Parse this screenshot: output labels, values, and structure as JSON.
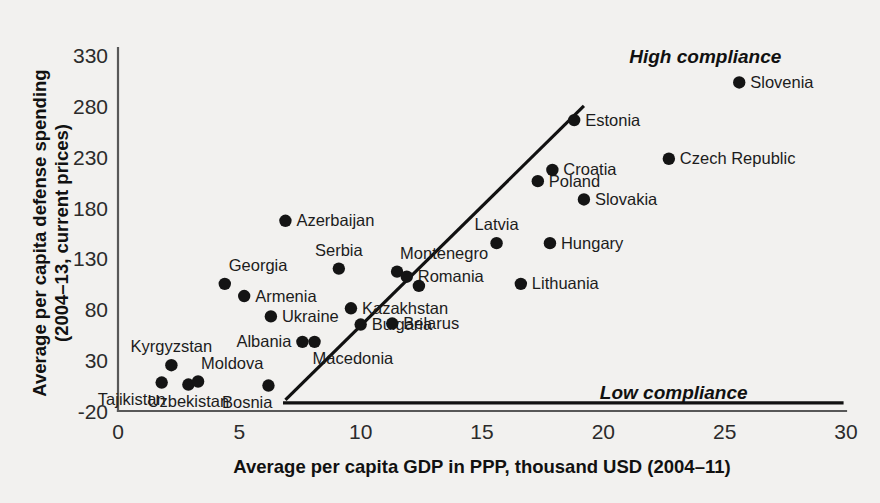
{
  "chart_data": {
    "type": "scatter",
    "title": "",
    "xlabel": "Average per capita GDP in PPP, thousand USD (2004–11)",
    "ylabel": "Average per capita defense spending\n(2004–13, current prices)",
    "xlim": [
      0,
      30
    ],
    "ylim": [
      -20,
      330
    ],
    "xticks": [
      "0",
      "5",
      "10",
      "15",
      "20",
      "25",
      "30"
    ],
    "xtick_values": [
      0,
      5,
      10,
      15,
      20,
      25,
      30
    ],
    "yticks": [
      "-20",
      "30",
      "80",
      "130",
      "180",
      "230",
      "280",
      "330"
    ],
    "ytick_values": [
      -20,
      30,
      80,
      130,
      180,
      230,
      280,
      330
    ],
    "grid": false,
    "legend": null,
    "annotations": [
      {
        "name": "high-compliance",
        "text": "High compliance",
        "x": 24.2,
        "y": 322,
        "style": "bold-italic"
      },
      {
        "name": "low-compliance",
        "text": "Low compliance",
        "x": 22.9,
        "y": -8,
        "style": "bold-italic"
      }
    ],
    "reference_lines": [
      {
        "name": "compliance-diagonal",
        "type": "segment",
        "x1": 6.9,
        "y1": -9,
        "x2": 19.2,
        "y2": 280
      },
      {
        "name": "compliance-baseline",
        "type": "segment",
        "x1": 6.8,
        "y1": -12,
        "x2": 29.9,
        "y2": -12
      }
    ],
    "points": [
      {
        "label": "Tajikistan",
        "x": 1.8,
        "y": 8,
        "label_pos": "below-left"
      },
      {
        "label": "Kyrgyzstan",
        "x": 2.2,
        "y": 25,
        "label_pos": "above"
      },
      {
        "label": "Uzbekistan",
        "x": 2.9,
        "y": 6,
        "label_pos": "below"
      },
      {
        "label": "Moldova",
        "x": 3.3,
        "y": 9,
        "label_pos": "above-right"
      },
      {
        "label": "Georgia",
        "x": 4.4,
        "y": 105,
        "label_pos": "above-left"
      },
      {
        "label": "Armenia",
        "x": 5.2,
        "y": 93,
        "label_pos": "right"
      },
      {
        "label": "Bosnia",
        "x": 6.2,
        "y": 5,
        "label_pos": "below-left"
      },
      {
        "label": "Ukraine",
        "x": 6.3,
        "y": 73,
        "label_pos": "right"
      },
      {
        "label": "Azerbaijan",
        "x": 6.9,
        "y": 167,
        "label_pos": "right"
      },
      {
        "label": "Albania",
        "x": 7.6,
        "y": 48,
        "label_pos": "left"
      },
      {
        "label": "Macedonia",
        "x": 8.1,
        "y": 48,
        "label_pos": "below-right"
      },
      {
        "label": "Serbia",
        "x": 9.1,
        "y": 120,
        "label_pos": "above"
      },
      {
        "label": "Kazakhstan",
        "x": 9.6,
        "y": 81,
        "label_pos": "right"
      },
      {
        "label": "Bulgaria",
        "x": 10.0,
        "y": 65,
        "label_pos": "right"
      },
      {
        "label": "Belarus",
        "x": 11.3,
        "y": 66,
        "label_pos": "right"
      },
      {
        "label": "Montenegro",
        "x": 11.5,
        "y": 117,
        "label_pos": "above-right"
      },
      {
        "label": "Romania",
        "x": 11.9,
        "y": 112,
        "label_pos": "right"
      },
      {
        "label": "Bulgaria2",
        "x": 12.4,
        "y": 103,
        "label_pos": "right"
      },
      {
        "label": "Latvia",
        "x": 15.6,
        "y": 145,
        "label_pos": "above"
      },
      {
        "label": "Lithuania",
        "x": 16.6,
        "y": 105,
        "label_pos": "right"
      },
      {
        "label": "Poland",
        "x": 17.3,
        "y": 206,
        "label_pos": "right"
      },
      {
        "label": "Hungary",
        "x": 17.8,
        "y": 145,
        "label_pos": "right"
      },
      {
        "label": "Croatia",
        "x": 17.9,
        "y": 217,
        "label_pos": "right"
      },
      {
        "label": "Estonia",
        "x": 18.8,
        "y": 266,
        "label_pos": "right"
      },
      {
        "label": "Slovakia",
        "x": 19.2,
        "y": 188,
        "label_pos": "right"
      },
      {
        "label": "Czech Republic",
        "x": 22.7,
        "y": 228,
        "label_pos": "right"
      },
      {
        "label": "Slovenia",
        "x": 25.6,
        "y": 303,
        "label_pos": "right"
      }
    ]
  }
}
